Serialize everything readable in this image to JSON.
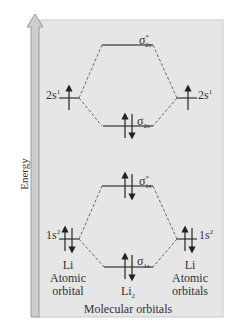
{
  "axis": {
    "label": "Energy"
  },
  "left_atom": {
    "valence": {
      "label": "2s",
      "sup": "1"
    },
    "core": {
      "label": "1s",
      "sup": "2"
    },
    "name": "Li",
    "caption_line1": "Atomic",
    "caption_line2": "orbital"
  },
  "right_atom": {
    "valence": {
      "label": "2s",
      "sup": "1"
    },
    "core": {
      "label": "1s",
      "sup": "2"
    },
    "name": "Li",
    "caption_line1": "Atomic",
    "caption_line2": "orbitals"
  },
  "molecule": {
    "name": "Li",
    "name_sub": "2",
    "caption": "Molecular orbitals",
    "orbitals": [
      {
        "id": "sigma_star_2s",
        "symbol": "σ",
        "sup": "*",
        "sub": "2s",
        "electrons": 0
      },
      {
        "id": "sigma_2s",
        "symbol": "σ",
        "sub": "2s",
        "electrons": 2
      },
      {
        "id": "sigma_star_1s",
        "symbol": "σ",
        "sup": "*",
        "sub": "1s",
        "electrons": 2
      },
      {
        "id": "sigma_1s",
        "symbol": "σ",
        "sub": "1s",
        "electrons": 2
      }
    ]
  },
  "colors": {
    "panel": "#e4e4e4",
    "level": "#7a7a7a",
    "arrow_fill": "#cfcfcf",
    "text": "#333333"
  }
}
